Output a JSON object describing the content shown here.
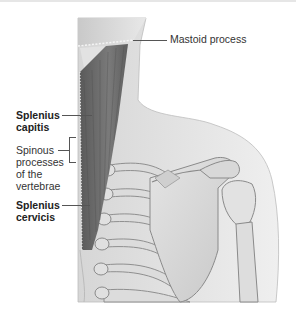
{
  "figure": {
    "palette": {
      "muscle": "#6b6b6b",
      "muscle_dark": "#4a4a4a",
      "bone": "#d9d9d9",
      "skin": "#e8e8e8",
      "outline": "#8a8a8a",
      "label_text": "#333333",
      "leader_line": "#555555"
    }
  },
  "labels": {
    "mastoid": "Mastoid process",
    "splenius_capitis": [
      "Splenius",
      "capitis"
    ],
    "spinous": [
      "Spinous",
      "processes",
      "of the",
      "vertebrae"
    ],
    "splenius_cervicis": [
      "Splenius",
      "cervicis"
    ]
  }
}
